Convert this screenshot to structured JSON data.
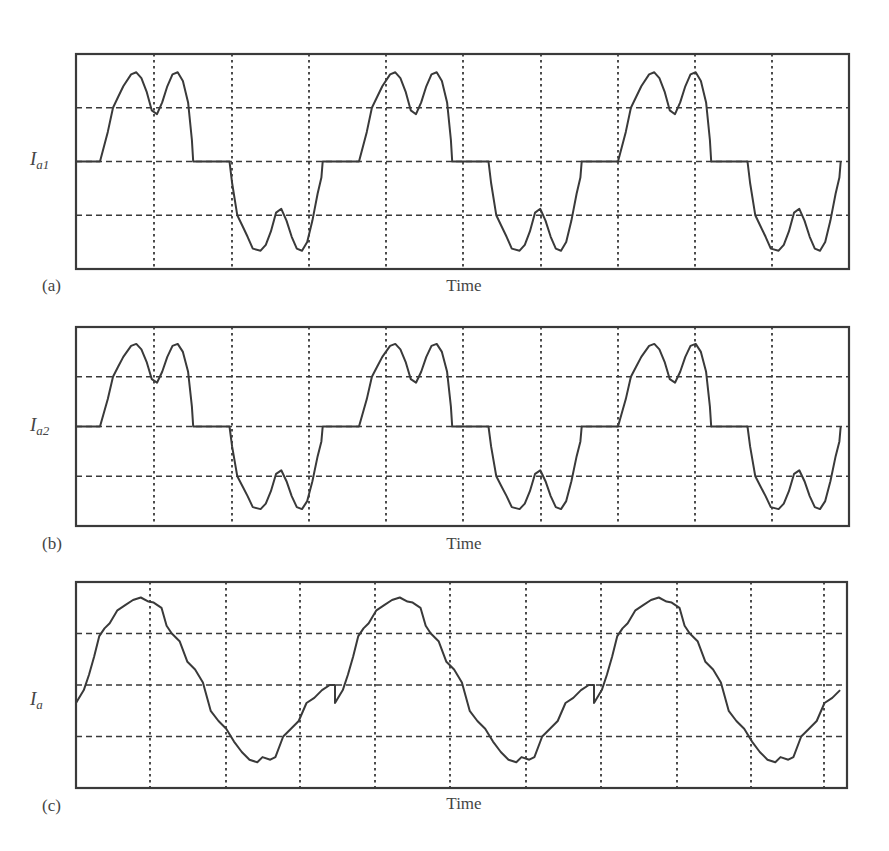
{
  "chart_data": [
    {
      "type": "line",
      "panel": "(a)",
      "title": "",
      "xlabel": "Time",
      "ylabel": "I_a1",
      "ylabel_main": "I",
      "ylabel_sub": "a1",
      "grid": true,
      "x_divisions": 10,
      "y_divisions": 4,
      "periods_shown": 3,
      "description": "Quasi-square six-step phase current with double-hump top and bottom, flat zero segments",
      "waveform_one_period": {
        "x": [
          0,
          0.03,
          0.05,
          0.07,
          0.09,
          0.12,
          0.14,
          0.16,
          0.18,
          0.2,
          0.22,
          0.24,
          0.26,
          0.28,
          0.3,
          0.32,
          0.34,
          0.355,
          0.36,
          0.5,
          0.51,
          0.53,
          0.55,
          0.57,
          0.59,
          0.62,
          0.64,
          0.66,
          0.68,
          0.7,
          0.72,
          0.74,
          0.76,
          0.78,
          0.8,
          0.82,
          0.84,
          0.855,
          0.86,
          1.0
        ],
        "y": [
          0,
          0.55,
          1.0,
          1.2,
          1.4,
          1.62,
          1.66,
          1.55,
          1.3,
          0.95,
          0.88,
          1.1,
          1.4,
          1.62,
          1.66,
          1.5,
          1.1,
          0.4,
          0,
          0,
          -0.4,
          -1.0,
          -1.2,
          -1.4,
          -1.62,
          -1.66,
          -1.55,
          -1.3,
          -0.95,
          -0.88,
          -1.1,
          -1.4,
          -1.62,
          -1.66,
          -1.5,
          -1.1,
          -0.6,
          -0.3,
          0,
          0
        ]
      },
      "phase_offset_px": 24,
      "period_px": 259
    },
    {
      "type": "line",
      "panel": "(b)",
      "title": "",
      "xlabel": "Time",
      "ylabel": "I_a2",
      "ylabel_main": "I",
      "ylabel_sub": "a2",
      "grid": true,
      "x_divisions": 10,
      "y_divisions": 4,
      "periods_shown": 3,
      "description": "Same quasi-square double-hump phase current as (a), second converter",
      "waveform_one_period": {
        "x": [
          0,
          0.03,
          0.05,
          0.07,
          0.09,
          0.12,
          0.14,
          0.16,
          0.18,
          0.2,
          0.22,
          0.24,
          0.26,
          0.28,
          0.3,
          0.32,
          0.34,
          0.355,
          0.36,
          0.5,
          0.51,
          0.53,
          0.55,
          0.57,
          0.59,
          0.62,
          0.64,
          0.66,
          0.68,
          0.7,
          0.72,
          0.74,
          0.76,
          0.78,
          0.8,
          0.82,
          0.84,
          0.855,
          0.86,
          1.0
        ],
        "y": [
          0,
          0.55,
          1.0,
          1.2,
          1.4,
          1.62,
          1.66,
          1.55,
          1.3,
          0.95,
          0.88,
          1.1,
          1.4,
          1.62,
          1.66,
          1.5,
          1.1,
          0.4,
          0,
          0,
          -0.4,
          -1.0,
          -1.2,
          -1.4,
          -1.62,
          -1.66,
          -1.55,
          -1.3,
          -0.95,
          -0.88,
          -1.1,
          -1.4,
          -1.62,
          -1.66,
          -1.5,
          -1.1,
          -0.6,
          -0.3,
          0,
          0
        ]
      },
      "phase_offset_px": 24,
      "period_px": 259
    },
    {
      "type": "line",
      "panel": "(c)",
      "title": "",
      "xlabel": "Time",
      "ylabel": "I_a",
      "ylabel_main": "I",
      "ylabel_sub": "a",
      "grid": true,
      "x_divisions": 10,
      "y_divisions": 4,
      "periods_shown": 3,
      "description": "Combined (summed) phase current, near-sinusoidal stepped waveform",
      "waveform_one_period": {
        "x": [
          0,
          0.03,
          0.05,
          0.07,
          0.09,
          0.11,
          0.13,
          0.16,
          0.19,
          0.22,
          0.25,
          0.28,
          0.3,
          0.33,
          0.35,
          0.37,
          0.4,
          0.43,
          0.46,
          0.49,
          0.52,
          0.55,
          0.58,
          0.61,
          0.64,
          0.67,
          0.7,
          0.72,
          0.75,
          0.77,
          0.8,
          0.83,
          0.86,
          0.89,
          0.92,
          0.95,
          0.98,
          1.0
        ],
        "y": [
          -0.35,
          -0.1,
          0.2,
          0.55,
          0.95,
          1.1,
          1.2,
          1.45,
          1.55,
          1.65,
          1.7,
          1.62,
          1.6,
          1.5,
          1.15,
          1.0,
          0.85,
          0.45,
          0.3,
          0.05,
          -0.5,
          -0.7,
          -0.85,
          -1.1,
          -1.3,
          -1.45,
          -1.5,
          -1.4,
          -1.45,
          -1.4,
          -1.0,
          -0.85,
          -0.7,
          -0.35,
          -0.25,
          -0.1,
          0.0,
          0.0
        ]
      },
      "phase_offset_px": 0,
      "period_px": 259
    }
  ],
  "panels": [
    {
      "letter": "(a)",
      "xlabel": "Time",
      "ylabel_main": "I",
      "ylabel_sub": "a1"
    },
    {
      "letter": "(b)",
      "xlabel": "Time",
      "ylabel_main": "I",
      "ylabel_sub": "a2"
    },
    {
      "letter": "(c)",
      "xlabel": "Time",
      "ylabel_main": "I",
      "ylabel_sub": "a"
    }
  ],
  "layout": {
    "plots": [
      {
        "x0": 76,
        "y0": 54,
        "x1": 849,
        "y1": 269,
        "vgrid": [
          154,
          232,
          309,
          386,
          463,
          541,
          618,
          695,
          772
        ]
      },
      {
        "x0": 76,
        "y0": 327,
        "x1": 849,
        "y1": 526,
        "vgrid": [
          154,
          232,
          309,
          386,
          463,
          541,
          618,
          695,
          772
        ]
      },
      {
        "x0": 76,
        "y0": 582,
        "x1": 847,
        "y1": 788,
        "vgrid": [
          150,
          226,
          300,
          375,
          450,
          526,
          601,
          677,
          751,
          824
        ]
      }
    ],
    "colors": {
      "line": "#3a3a3a",
      "background": "#ffffff",
      "text": "#444444"
    }
  }
}
